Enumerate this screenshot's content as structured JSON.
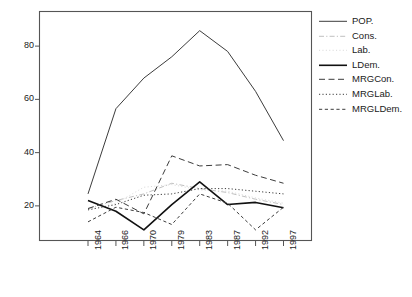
{
  "chart_data": {
    "type": "line",
    "title": "",
    "xlabel": "",
    "ylabel": "",
    "categories": [
      "1964",
      "1966",
      "1970",
      "1979",
      "1983",
      "1987",
      "1992",
      "1997"
    ],
    "x_tick_labels": [
      "1964",
      "1966",
      "1970",
      "1979",
      "1983",
      "1987",
      "1992",
      "1997"
    ],
    "y_tick_labels": [
      "20",
      "40",
      "60",
      "80"
    ],
    "y_ticks": [
      20,
      40,
      60,
      80
    ],
    "ylim": [
      7,
      93
    ],
    "xlim": [
      0,
      7
    ],
    "grid": false,
    "legend_position": "right",
    "series": [
      {
        "name": "POP.",
        "label": "POP.",
        "style": "solid",
        "width": 1.0,
        "color": "#3c3c3c",
        "values": [
          24.5,
          56.5,
          68.0,
          76.0,
          85.8,
          78.0,
          63.0,
          44.5
        ]
      },
      {
        "name": "Cons.",
        "label": "Cons.",
        "style": "dashdot",
        "width": 0.9,
        "color": "#b8b8b8",
        "values": [
          19.0,
          22.0,
          24.5,
          28.5,
          26.5,
          25.0,
          22.5,
          20.5
        ]
      },
      {
        "name": "Lab.",
        "label": "Lab.",
        "style": "dotted-light",
        "width": 0.9,
        "color": "#d6d6d6",
        "values": [
          18.5,
          21.0,
          27.0,
          28.0,
          26.0,
          25.5,
          23.0,
          21.0
        ]
      },
      {
        "name": "LDem.",
        "label": "LDem.",
        "style": "solid",
        "width": 1.6,
        "color": "#111111",
        "values": [
          22.0,
          18.0,
          11.0,
          20.5,
          29.0,
          20.5,
          21.3,
          19.3
        ]
      },
      {
        "name": "MRGCon.",
        "label": "MRGCon.",
        "style": "dashed-long",
        "width": 1.0,
        "color": "#3c3c3c",
        "values": [
          19.0,
          22.5,
          17.0,
          38.8,
          35.0,
          35.5,
          31.5,
          28.5
        ]
      },
      {
        "name": "MRGLab.",
        "label": "MRGLab.",
        "style": "dotted",
        "width": 1.0,
        "color": "#3c3c3c",
        "values": [
          18.5,
          20.5,
          24.0,
          24.5,
          26.5,
          26.5,
          25.5,
          24.5
        ]
      },
      {
        "name": "MRGLDem.",
        "label": "MRGLDem.",
        "style": "dashed-short",
        "width": 1.0,
        "color": "#3c3c3c",
        "values": [
          14.0,
          19.5,
          17.5,
          13.0,
          24.5,
          21.0,
          11.0,
          19.5
        ]
      }
    ]
  },
  "legend": {
    "items": [
      {
        "label": "POP."
      },
      {
        "label": "Cons."
      },
      {
        "label": "Lab."
      },
      {
        "label": "LDem."
      },
      {
        "label": "MRGCon."
      },
      {
        "label": "MRGLab."
      },
      {
        "label": "MRGLDem."
      }
    ]
  }
}
